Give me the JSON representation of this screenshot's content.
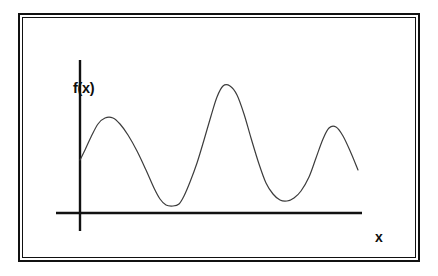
{
  "figure": {
    "title": "",
    "background_color": "#ffffff",
    "frame": {
      "style": "double-line-rectangle",
      "color": "#111111"
    },
    "axes": {
      "y_label": "f(x)",
      "x_label": "x",
      "axis_color": "#111111",
      "y_axis": {
        "x": 80,
        "y_top": 60,
        "y_bottom": 231
      },
      "x_axis": {
        "y": 213,
        "x_left": 56,
        "x_right": 362
      }
    },
    "curve": {
      "color": "#3c3c3c",
      "stroke_width": 1.2,
      "name": "f-of-x-curve"
    }
  },
  "chart_data": {
    "type": "line",
    "title": "",
    "xlabel": "x",
    "ylabel": "f(x)",
    "grid": false,
    "legend": null,
    "axis_ticks": {
      "x": [],
      "y": []
    },
    "xlim": [
      0,
      392
    ],
    "ylim": [
      0,
      239
    ],
    "features": {
      "start_point": {
        "x": 57,
        "y": 142
      },
      "end_point": {
        "x": 335,
        "y": 152
      },
      "maxima": [
        {
          "label": "peak-1",
          "x": 82,
          "y": 100,
          "relative_height": "medium"
        },
        {
          "label": "peak-2",
          "x": 199,
          "y": 68,
          "relative_height": "tallest"
        },
        {
          "label": "peak-3",
          "x": 307,
          "y": 109,
          "relative_height": "medium"
        }
      ],
      "minima": [
        {
          "label": "valley-1",
          "x": 142,
          "y": 187,
          "relative_depth": "lowest"
        },
        {
          "label": "valley-2",
          "x": 264,
          "y": 183,
          "relative_depth": "low"
        }
      ]
    },
    "path_points": [
      {
        "x": 57,
        "y": 142
      },
      {
        "x": 62,
        "y": 132
      },
      {
        "x": 68,
        "y": 119
      },
      {
        "x": 75,
        "y": 106
      },
      {
        "x": 82,
        "y": 100
      },
      {
        "x": 90,
        "y": 100
      },
      {
        "x": 97,
        "y": 106
      },
      {
        "x": 105,
        "y": 117
      },
      {
        "x": 114,
        "y": 133
      },
      {
        "x": 123,
        "y": 152
      },
      {
        "x": 131,
        "y": 170
      },
      {
        "x": 137,
        "y": 181
      },
      {
        "x": 143,
        "y": 187
      },
      {
        "x": 150,
        "y": 188
      },
      {
        "x": 156,
        "y": 186
      },
      {
        "x": 161,
        "y": 178
      },
      {
        "x": 167,
        "y": 164
      },
      {
        "x": 174,
        "y": 145
      },
      {
        "x": 181,
        "y": 122
      },
      {
        "x": 188,
        "y": 98
      },
      {
        "x": 194,
        "y": 79
      },
      {
        "x": 200,
        "y": 68
      },
      {
        "x": 207,
        "y": 68
      },
      {
        "x": 214,
        "y": 77
      },
      {
        "x": 221,
        "y": 96
      },
      {
        "x": 228,
        "y": 120
      },
      {
        "x": 236,
        "y": 146
      },
      {
        "x": 243,
        "y": 165
      },
      {
        "x": 250,
        "y": 176
      },
      {
        "x": 257,
        "y": 182
      },
      {
        "x": 264,
        "y": 183
      },
      {
        "x": 271,
        "y": 180
      },
      {
        "x": 278,
        "y": 173
      },
      {
        "x": 286,
        "y": 159
      },
      {
        "x": 293,
        "y": 140
      },
      {
        "x": 300,
        "y": 121
      },
      {
        "x": 306,
        "y": 110
      },
      {
        "x": 313,
        "y": 109
      },
      {
        "x": 320,
        "y": 118
      },
      {
        "x": 328,
        "y": 135
      },
      {
        "x": 335,
        "y": 152
      }
    ]
  }
}
